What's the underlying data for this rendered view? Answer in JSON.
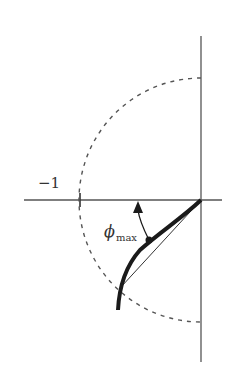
{
  "figure": {
    "type": "nyquist_phase_margin_diagram",
    "labels": {
      "real_axis_tick": "−1",
      "angle_symbol": "ϕ",
      "angle_subscript": "max"
    },
    "elements": {
      "real_axis": "horizontal axis",
      "imaginary_axis": "vertical axis",
      "unit_circle": "dashed semicircle of radius 1 centered at origin (left half)",
      "nyquist_curve": "thick curve from lower-left into origin",
      "tangent_line": "thin line from origin to circle crossing point",
      "angle_arrow": "curved arrow from curve to negative real axis indicating phi_max"
    },
    "colors": {
      "axis": "#555555",
      "curve": "#1a1a1a",
      "circle": "#555555",
      "text": "#333333"
    },
    "geometry": {
      "origin": [
        201,
        200
      ],
      "radius_px": 122,
      "minus_one_tick_x": 79
    }
  }
}
